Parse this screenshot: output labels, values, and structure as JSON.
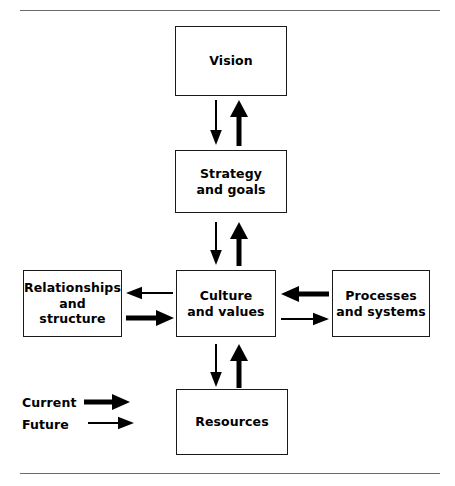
{
  "diagram": {
    "ink_color": "#000000",
    "rule_color": "#6b6b6b",
    "boxes": {
      "vision": "Vision",
      "strategy": "Strategy\nand goals",
      "culture": "Culture\nand values",
      "relationships": "Relationships\nand structure",
      "processes": "Processes\nand systems",
      "resources": "Resources"
    },
    "legend": {
      "current_label": "Current",
      "future_label": "Future"
    },
    "connections": [
      {
        "from": "strategy",
        "to": "vision",
        "style": "current",
        "direction": "up"
      },
      {
        "from": "vision",
        "to": "strategy",
        "style": "future",
        "direction": "down"
      },
      {
        "from": "culture",
        "to": "strategy",
        "style": "current",
        "direction": "up"
      },
      {
        "from": "strategy",
        "to": "culture",
        "style": "future",
        "direction": "down"
      },
      {
        "from": "culture",
        "to": "relationships",
        "style": "future",
        "direction": "left"
      },
      {
        "from": "relationships",
        "to": "culture",
        "style": "current",
        "direction": "right"
      },
      {
        "from": "processes",
        "to": "culture",
        "style": "current",
        "direction": "left"
      },
      {
        "from": "culture",
        "to": "processes",
        "style": "future",
        "direction": "right"
      },
      {
        "from": "culture",
        "to": "resources",
        "style": "future",
        "direction": "down"
      },
      {
        "from": "resources",
        "to": "culture",
        "style": "current",
        "direction": "up"
      }
    ]
  }
}
